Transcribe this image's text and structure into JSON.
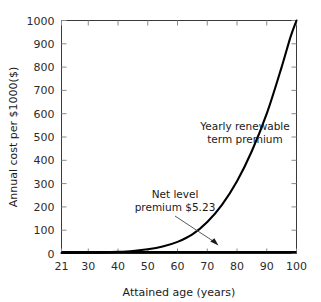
{
  "chart_data": {
    "type": "line",
    "title": "",
    "xlabel": "Attained age (years)",
    "ylabel": "Annual cost per $1000($)",
    "xlim": [
      21,
      100
    ],
    "ylim": [
      0,
      1000
    ],
    "grid": false,
    "legend": "none",
    "x_ticks": [
      "21",
      "30",
      "40",
      "50",
      "60",
      "70",
      "80",
      "90",
      "100"
    ],
    "x_tick_values": [
      21,
      30,
      40,
      50,
      60,
      70,
      80,
      90,
      100
    ],
    "y_ticks": [
      "0",
      "100",
      "200",
      "300",
      "400",
      "500",
      "600",
      "700",
      "800",
      "900",
      "1000"
    ],
    "y_tick_values": [
      0,
      100,
      200,
      300,
      400,
      500,
      600,
      700,
      800,
      900,
      1000
    ],
    "series": [
      {
        "name": "Yearly renewable term premium",
        "x": [
          21,
          25,
          30,
          35,
          40,
          45,
          50,
          55,
          60,
          65,
          70,
          75,
          80,
          85,
          90,
          95,
          98,
          100
        ],
        "values": [
          2,
          2.5,
          3.2,
          4.5,
          7,
          11,
          18,
          30,
          50,
          82,
          135,
          210,
          310,
          440,
          600,
          800,
          930,
          1000
        ]
      },
      {
        "name": "Net level premium $5.23",
        "x": [
          21,
          100
        ],
        "values": [
          5.23,
          5.23
        ]
      }
    ],
    "annotations": [
      {
        "name": "yearly-renewable-term-premium-label",
        "line1": "Yearly renewable",
        "line2": "term premium"
      },
      {
        "name": "net-level-premium-label",
        "line1": "Net level",
        "line2": "premium $5.23"
      }
    ],
    "colors": {
      "curve": "#000000",
      "level_line": "#000000",
      "axis": "#3a3a3a",
      "tick": "#8a8a8a",
      "text": "#1a1a1a",
      "arrow": "#5a5a5a",
      "background": "#ffffff"
    }
  }
}
